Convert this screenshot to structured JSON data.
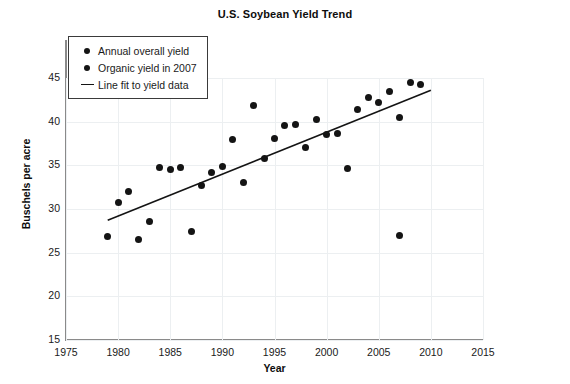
{
  "chart_data": {
    "type": "scatter",
    "title": "U.S. Soybean Yield Trend",
    "xlabel": "Year",
    "ylabel": "Buschels per acre",
    "xlim": [
      1975,
      2015
    ],
    "ylim": [
      15,
      45
    ],
    "xticks": [
      1975,
      1980,
      1985,
      1990,
      1995,
      2000,
      2005,
      2010,
      2015
    ],
    "yticks": [
      15,
      20,
      25,
      30,
      35,
      40,
      45
    ],
    "grid": true,
    "legend_position": "upper-left",
    "marker_color": "#141414",
    "line_color": "#141414",
    "series": [
      {
        "name": "Annual overall yield",
        "type": "scatter",
        "x": [
          1979,
          1980,
          1981,
          1982,
          1983,
          1984,
          1985,
          1986,
          1987,
          1988,
          1989,
          1990,
          1991,
          1992,
          1993,
          1994,
          1995,
          1996,
          1997,
          1998,
          1999,
          2000,
          2001,
          2002,
          2003,
          2004,
          2005,
          2006,
          2007,
          2008,
          2009
        ],
        "y": [
          26.8,
          30.7,
          32.0,
          26.5,
          28.6,
          34.7,
          34.5,
          34.7,
          27.4,
          32.7,
          34.2,
          34.9,
          38.0,
          33.0,
          41.9,
          35.8,
          38.1,
          39.6,
          39.7,
          37.0,
          40.3,
          38.5,
          38.7,
          34.6,
          41.4,
          42.8,
          42.2,
          43.5,
          40.5,
          44.5,
          44.2
        ]
      },
      {
        "name": "Organic yield in 2007",
        "type": "scatter",
        "x": [
          2007
        ],
        "y": [
          27.0
        ]
      },
      {
        "name": "Line fit to yield data",
        "type": "line",
        "x": [
          1979,
          2010
        ],
        "y": [
          28.7,
          43.6
        ]
      }
    ]
  },
  "legend": {
    "entries": [
      {
        "label": "Annual overall yield",
        "marker": "dot"
      },
      {
        "label": "Organic yield in 2007",
        "marker": "dot"
      },
      {
        "label": "Line fit to yield data",
        "marker": "line"
      }
    ]
  }
}
